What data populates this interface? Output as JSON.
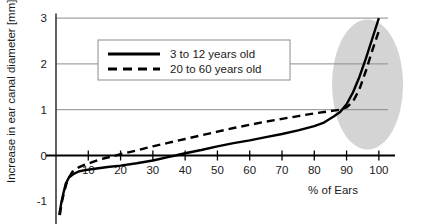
{
  "chart_data": {
    "type": "line",
    "title": "",
    "xlabel": "% of Ears",
    "ylabel": "Increase in ear canal diameter [mm]",
    "xlim": [
      0,
      105
    ],
    "ylim": [
      -1.35,
      3.1
    ],
    "xticks": [
      10,
      20,
      30,
      40,
      50,
      60,
      70,
      80,
      90,
      100
    ],
    "xticklabels": [
      "10",
      "20",
      "30",
      "40",
      "50",
      "60",
      "70",
      "80",
      "90",
      "100"
    ],
    "yticks": [
      -1,
      0,
      1,
      2,
      3
    ],
    "yticklabels": [
      "-1",
      "0",
      "1",
      "2",
      "3"
    ],
    "grid": "horizontal",
    "legend_position": "upper-center",
    "series": [
      {
        "name": "3 to 12 years old",
        "style": "solid",
        "color": "#000000",
        "x": [
          1.0,
          1.6,
          2.2,
          3.0,
          4.0,
          5.5,
          7.0,
          9.0,
          12.0,
          16.0,
          20.0,
          25.0,
          30.0,
          35.0,
          37.0,
          40.0,
          45.0,
          50.0,
          55.0,
          60.0,
          65.0,
          70.0,
          75.0,
          80.0,
          83.0,
          86.0,
          88.0,
          90.0,
          92.0,
          94.0,
          96.0,
          98.0,
          100.0
        ],
        "y": [
          -1.3,
          -1.05,
          -0.85,
          -0.62,
          -0.48,
          -0.4,
          -0.35,
          -0.32,
          -0.29,
          -0.25,
          -0.22,
          -0.17,
          -0.11,
          -0.03,
          0.0,
          0.05,
          0.12,
          0.2,
          0.27,
          0.33,
          0.4,
          0.47,
          0.55,
          0.64,
          0.72,
          0.85,
          0.95,
          1.12,
          1.38,
          1.72,
          2.12,
          2.56,
          3.0
        ]
      },
      {
        "name": "20 to 60 years old",
        "style": "dashed",
        "color": "#000000",
        "x": [
          1.2,
          1.8,
          2.5,
          3.5,
          5.0,
          7.0,
          9.0,
          11.0,
          13.0,
          15.0,
          18.0,
          20.0,
          25.0,
          30.0,
          35.0,
          40.0,
          45.0,
          50.0,
          55.0,
          60.0,
          65.0,
          70.0,
          75.0,
          80.0,
          83.0,
          86.0,
          88.0,
          90.0,
          92.0,
          94.0,
          96.0,
          98.0,
          100.0
        ],
        "y": [
          -1.3,
          -1.02,
          -0.8,
          -0.55,
          -0.36,
          -0.26,
          -0.2,
          -0.15,
          -0.1,
          -0.06,
          -0.01,
          0.03,
          0.11,
          0.2,
          0.28,
          0.36,
          0.44,
          0.52,
          0.6,
          0.67,
          0.74,
          0.8,
          0.86,
          0.92,
          0.95,
          0.98,
          1.0,
          1.05,
          1.18,
          1.45,
          1.85,
          2.3,
          2.72
        ]
      }
    ],
    "annotations": [
      {
        "type": "ellipse-highlight",
        "color": "#d4d4d4",
        "x_center": 96.5,
        "y_center": 1.55,
        "x_radius": 11.0,
        "y_radius": 1.42
      }
    ]
  },
  "legend": {
    "entries": [
      {
        "label": "3 to 12 years old",
        "style": "solid"
      },
      {
        "label": "20 to 60 years old",
        "style": "dashed"
      }
    ]
  }
}
